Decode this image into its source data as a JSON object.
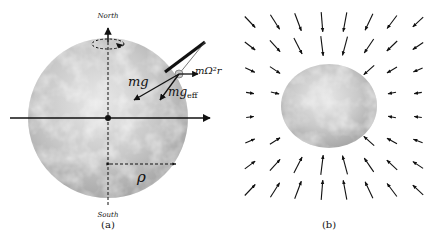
{
  "panel_a": {
    "north_label": "North",
    "south_label": "South",
    "mg_label": "mg",
    "mgeff_label_main": "mg",
    "mgeff_label_sub": "eff",
    "centrifugal_label": "mΩ²r",
    "rho_label": "ρ",
    "caption": "(a)"
  },
  "panel_b": {
    "caption": "(b)",
    "field": {
      "columns": 8,
      "rows": 8,
      "description": "gravitational field vectors pointing toward the Earth"
    }
  },
  "colors": {
    "ink": "#111111",
    "earth_light": "#e4e4e4",
    "earth_dark": "#9a9a9a"
  }
}
